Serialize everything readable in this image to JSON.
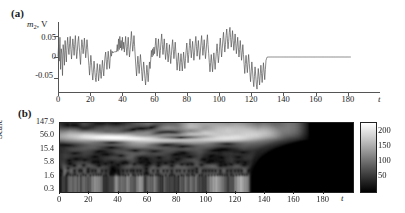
{
  "figure": {
    "panel_a_tag": "(a)",
    "panel_b_tag": "(b)"
  },
  "panel_a": {
    "ylabel_main": "m",
    "ylabel_sub": "2",
    "ylabel_unit": ", V",
    "yticks": [
      "0.05",
      "0",
      "-0.05"
    ],
    "ytick_values": [
      0.05,
      0,
      -0.05
    ],
    "ylim": [
      -0.085,
      0.085
    ],
    "xticks": [
      "0",
      "20",
      "40",
      "60",
      "80",
      "100",
      "120",
      "140",
      "160",
      "180"
    ],
    "xtick_values": [
      0,
      20,
      40,
      60,
      80,
      100,
      120,
      140,
      160,
      180
    ],
    "xlim": [
      0,
      200
    ],
    "xlabel": "t",
    "line_color": "#555555"
  },
  "panel_b": {
    "ylabel": "Scale",
    "yticks": [
      "147.9",
      "56.0",
      "15.4",
      "5.8",
      "1.6",
      "0.3"
    ],
    "ytick_values": [
      147.9,
      56.0,
      15.4,
      5.8,
      1.6,
      0.3
    ],
    "xticks": [
      "0",
      "20",
      "40",
      "60",
      "80",
      "100",
      "120",
      "140",
      "160",
      "180"
    ],
    "xtick_values": [
      0,
      20,
      40,
      60,
      80,
      100,
      120,
      140,
      160,
      180
    ],
    "xlim": [
      0,
      200
    ],
    "xlabel": "t",
    "colorbar": {
      "ticks": [
        "200",
        "150",
        "100",
        "50"
      ],
      "tick_values": [
        200,
        150,
        100,
        50
      ],
      "range": [
        0,
        230
      ],
      "low_color": "#000000",
      "high_color": "#ffffff"
    }
  },
  "chart_data": {
    "type": "line",
    "title": "",
    "xlabel": "t",
    "ylabel": "m2, V",
    "xlim": [
      0,
      200
    ],
    "ylim": [
      -0.085,
      0.085
    ],
    "grid": false,
    "legend": null,
    "series": [
      {
        "name": "m2",
        "description": "Chaotic oscillation voltage signal that collapses to zero after t approximately 130",
        "collapse_time": 130,
        "post_collapse_value": 0.0,
        "x_step": 0.4,
        "values": [
          0.002,
          0.03,
          -0.01,
          0.048,
          -0.03,
          0.02,
          0.007,
          -0.045,
          0.03,
          0.01,
          -0.02,
          0.04,
          0.015,
          -0.012,
          0.028,
          0.048,
          0.022,
          0.006,
          0.032,
          0.05,
          0.018,
          -0.005,
          0.02,
          0.044,
          0.026,
          0.004,
          0.03,
          0.052,
          0.02,
          -0.004,
          0.014,
          0.038,
          0.05,
          0.024,
          0.002,
          -0.018,
          0.016,
          0.042,
          0.03,
          0.008,
          0.024,
          0.046,
          0.02,
          -0.002,
          0.018,
          0.042,
          0.024,
          0.0,
          -0.02,
          -0.044,
          -0.02,
          0.004,
          -0.014,
          -0.038,
          -0.056,
          -0.034,
          -0.01,
          -0.03,
          -0.05,
          -0.06,
          -0.038,
          -0.016,
          -0.034,
          -0.058,
          -0.04,
          -0.018,
          -0.036,
          -0.052,
          -0.03,
          -0.008,
          -0.028,
          -0.046,
          -0.022,
          0.0,
          0.012,
          -0.01,
          -0.03,
          -0.006,
          0.014,
          -0.008,
          -0.028,
          -0.004,
          0.018,
          0.002,
          0.014,
          0.01,
          0.012,
          0.011,
          0.013,
          0.012,
          0.014,
          0.013,
          0.03,
          0.014,
          0.044,
          0.018,
          0.05,
          0.022,
          0.04,
          0.016,
          0.048,
          0.02,
          0.036,
          0.012,
          0.03,
          0.05,
          0.024,
          0.004,
          0.026,
          0.048,
          0.022,
          0.0,
          0.018,
          0.04,
          0.062,
          0.038,
          0.014,
          0.03,
          0.052,
          0.026,
          0.0,
          -0.024,
          -0.046,
          -0.022,
          0.002,
          -0.018,
          -0.04,
          -0.016,
          0.006,
          -0.014,
          -0.036,
          -0.058,
          -0.034,
          -0.012,
          -0.03,
          -0.052,
          -0.068,
          -0.044,
          -0.02,
          -0.038,
          -0.06,
          -0.036,
          -0.012,
          -0.028,
          -0.006,
          0.016,
          0.0,
          0.02,
          0.004,
          0.024,
          0.008,
          0.028,
          0.046,
          0.022,
          0.002,
          0.022,
          0.044,
          0.02,
          -0.002,
          0.016,
          0.038,
          0.056,
          0.03,
          0.006,
          0.024,
          0.044,
          0.018,
          -0.006,
          0.012,
          0.034,
          0.01,
          -0.012,
          0.008,
          0.03,
          0.006,
          -0.016,
          0.004,
          0.026,
          0.042,
          0.018,
          -0.004,
          0.014,
          0.036,
          0.012,
          -0.01,
          -0.032,
          -0.01,
          0.01,
          -0.012,
          -0.034,
          -0.012,
          0.008,
          -0.014,
          -0.034,
          -0.01,
          0.012,
          -0.008,
          -0.028,
          -0.004,
          0.016,
          0.034,
          0.01,
          -0.014,
          0.006,
          0.028,
          0.044,
          0.02,
          -0.002,
          0.018,
          0.038,
          0.014,
          -0.008,
          0.01,
          0.032,
          0.05,
          0.026,
          0.002,
          0.02,
          0.04,
          0.016,
          -0.006,
          0.012,
          0.034,
          0.052,
          0.028,
          0.004,
          0.022,
          0.042,
          0.018,
          -0.004,
          0.014,
          0.036,
          0.054,
          0.03,
          0.008,
          -0.014,
          -0.036,
          -0.014,
          0.006,
          -0.016,
          -0.036,
          -0.012,
          0.01,
          -0.01,
          -0.03,
          -0.006,
          0.014,
          0.032,
          0.008,
          -0.014,
          0.004,
          0.026,
          0.046,
          0.022,
          0.0,
          0.02,
          0.042,
          0.06,
          0.036,
          0.012,
          0.03,
          0.052,
          0.068,
          0.044,
          0.02,
          0.038,
          0.06,
          0.072,
          0.048,
          0.024,
          0.042,
          0.064,
          0.04,
          0.016,
          0.034,
          0.056,
          0.032,
          0.008,
          0.026,
          0.048,
          0.024,
          0.0,
          0.018,
          0.04,
          0.016,
          -0.008,
          0.01,
          0.03,
          0.006,
          -0.018,
          -0.04,
          -0.016,
          0.004,
          -0.018,
          -0.038,
          -0.014,
          0.006,
          -0.016,
          -0.038,
          -0.06,
          -0.036,
          -0.012,
          -0.032,
          -0.055,
          -0.072,
          -0.048,
          -0.024,
          -0.044,
          -0.066,
          -0.078,
          -0.054,
          -0.028,
          -0.048,
          -0.068,
          -0.044,
          -0.02,
          -0.04,
          -0.062,
          -0.038,
          -0.014,
          -0.034,
          -0.055,
          -0.03,
          -0.008,
          -0.003,
          0.0,
          0.0,
          0.0,
          0.0,
          0.0,
          0.0,
          0.0,
          0.0,
          0.0,
          0.0,
          0.0,
          0.0,
          0.0,
          0.0,
          0.0,
          0.0,
          0.0,
          0.0,
          0.0,
          0.0,
          0.0,
          0.0,
          0.0,
          0.0,
          0.0,
          0.0,
          0.0,
          0.0,
          0.0,
          0.0,
          0.0,
          0.0,
          0.0,
          0.0,
          0.0,
          0.0,
          0.0,
          0.0,
          0.0,
          0.0,
          0.0,
          0.0,
          0.0,
          0.0,
          0.0,
          0.0,
          0.0,
          0.0,
          0.0,
          0.0,
          0.0,
          0.0,
          0.0,
          0.0,
          0.0,
          0.0,
          0.0,
          0.0,
          0.0,
          0.0,
          0.0,
          0.0,
          0.0,
          0.0,
          0.0,
          0.0,
          0.0,
          0.0,
          0.0,
          0.0,
          0.0,
          0.0,
          0.0,
          0.0,
          0.0,
          0.0,
          0.0,
          0.0,
          0.0,
          0.0,
          0.0,
          0.0,
          0.0,
          0.0,
          0.0,
          0.0,
          0.0,
          0.0,
          0.0,
          0.0,
          0.0,
          0.0,
          0.0,
          0.0,
          0.0,
          0.0,
          0.0,
          0.0,
          0.0,
          0.0,
          0.0,
          0.0,
          0.0,
          0.0,
          0.0,
          0.0,
          0.0,
          0.0,
          0.0,
          0.0,
          0.0,
          0.0,
          0.0,
          0.0,
          0.0,
          0.0,
          0.0,
          0.0,
          0.0,
          0.0,
          0.0,
          0.0,
          0.0,
          0.0,
          0.0,
          0.0,
          0.0,
          0.0,
          0.0,
          0.0
        ]
      }
    ],
    "scalogram": {
      "type": "heatmap",
      "description": "Continuous wavelet transform magnitude of m2; bright ridges until t approximately 130 then near-zero",
      "xlim": [
        0,
        200
      ],
      "scale_ticks": [
        147.9,
        56.0,
        15.4,
        5.8,
        1.6,
        0.3
      ],
      "value_range": [
        0,
        230
      ],
      "collapse_time": 130
    }
  }
}
